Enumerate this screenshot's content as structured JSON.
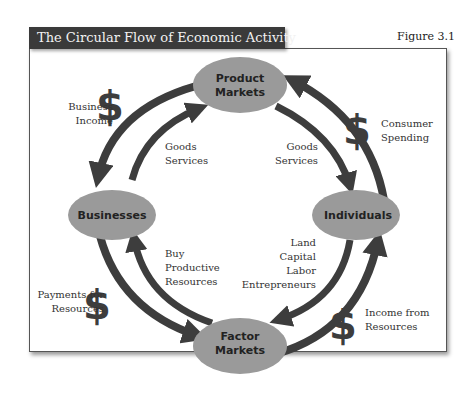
{
  "header": {
    "title": "The Circular Flow of Economic Activity",
    "figure": "Figure 3.1"
  },
  "nodes": {
    "product_markets": [
      "Product",
      "Markets"
    ],
    "businesses": [
      "Businesses"
    ],
    "individuals": [
      "Individuals"
    ],
    "factor_markets": [
      "Factor",
      "Markets"
    ]
  },
  "flows": {
    "business_income": [
      "Business",
      "Income"
    ],
    "goods_services_left": [
      "Goods",
      "Services"
    ],
    "goods_services_right": [
      "Goods",
      "Services"
    ],
    "consumer_spending": [
      "Consumer",
      "Spending"
    ],
    "buy_productive_resources": [
      "Buy",
      "Productive",
      "Resources"
    ],
    "land_capital_labor": [
      "Land",
      "Capital",
      "Labor",
      "Entrepreneurs"
    ],
    "payments_for_resources": [
      "Payments for",
      "Resources"
    ],
    "income_from_resources": [
      "Income from",
      "Resources"
    ]
  },
  "symbols": {
    "dollar": "$"
  },
  "colors": {
    "node_fill": "#9a9a9a",
    "arrow": "#3d3d3d",
    "title_bg": "#3a3a3a"
  }
}
